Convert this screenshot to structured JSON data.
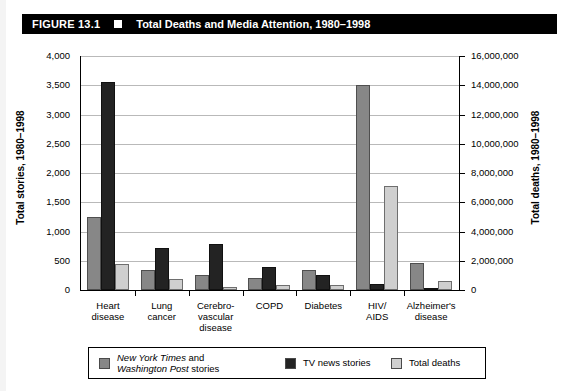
{
  "figure": {
    "number": "FIGURE 13.1",
    "marker_icon": "filled-square-icon",
    "title": "Total Deaths and Media Attention, 1980–1998"
  },
  "colors": {
    "newspaper": "#878787",
    "tv": "#232323",
    "deaths": "#cfcfcf",
    "title_bar_bg": "#000000",
    "title_bar_fg": "#ffffff",
    "gridline": "#b9b9b9"
  },
  "legend": {
    "position": "bottom",
    "items": [
      {
        "label_line1_italic": "New York Times",
        "label_line1_rest": " and",
        "label_line2_italic": "Washington Post",
        "label_line2_rest": " stories",
        "swatch": "newspaper"
      },
      {
        "label": "TV news stories",
        "swatch": "tv"
      },
      {
        "label": "Total deaths",
        "swatch": "deaths"
      }
    ]
  },
  "chart_data": {
    "type": "bar",
    "title": "Total Deaths and Media Attention, 1980–1998",
    "xlabel": "",
    "ylabel": "Total stories, 1980–1998",
    "y2label": "Total deaths, 1980–1998",
    "grid": true,
    "ylim": [
      0,
      4000
    ],
    "y2lim": [
      0,
      16000000
    ],
    "yticks": [
      "0",
      "500",
      "1,000",
      "1,500",
      "2,000",
      "2,500",
      "3,000",
      "3,500",
      "4,000"
    ],
    "ytick_values": [
      0,
      500,
      1000,
      1500,
      2000,
      2500,
      3000,
      3500,
      4000
    ],
    "y2ticks": [
      "0",
      "2,000,000",
      "4,000,000",
      "6,000,000",
      "8,000,000",
      "10,000,000",
      "12,000,000",
      "14,000,000",
      "16,000,000"
    ],
    "y2tick_values": [
      0,
      2000000,
      4000000,
      6000000,
      8000000,
      10000000,
      12000000,
      14000000,
      16000000
    ],
    "categories": [
      "Heart\ndisease",
      "Lung\ncancer",
      "Cerebro-\nvascular\ndisease",
      "COPD",
      "Diabetes",
      "HIV/\nAIDS",
      "Alzheimer's\ndisease"
    ],
    "series": [
      {
        "name": "New York Times and Washington Post stories",
        "axis": "left",
        "color": "#878787",
        "values": [
          1250,
          340,
          260,
          210,
          350,
          3500,
          470
        ]
      },
      {
        "name": "TV news stories",
        "axis": "left",
        "color": "#232323",
        "values": [
          3550,
          710,
          780,
          400,
          250,
          100,
          30
        ]
      },
      {
        "name": "Total deaths",
        "axis": "right",
        "color": "#cfcfcf",
        "values": [
          1800000,
          720000,
          220000,
          340000,
          360000,
          7120000,
          600000
        ]
      }
    ]
  }
}
